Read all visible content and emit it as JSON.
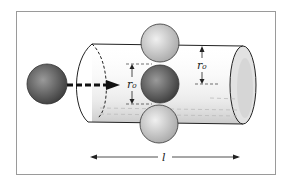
{
  "diagram": {
    "labels": {
      "radius_center": "r₀",
      "radius_right": "r₀",
      "length": "l"
    },
    "colors": {
      "frame": "#9a9a9a",
      "line": "#222222",
      "sphere_dark": "#555555",
      "sphere_light": "#bdbdbd"
    }
  }
}
